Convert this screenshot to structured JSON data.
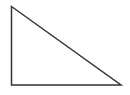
{
  "figure": {
    "name": "right-triangle",
    "canvas": {
      "width": 130,
      "height": 95,
      "background_color": "#ffffff"
    },
    "shape": {
      "type": "triangle",
      "variant": "right-triangle",
      "right_angle_vertex": "bottom-left",
      "stroke_color": "#333333",
      "stroke_width": 1.5,
      "fill": "none",
      "vertices": [
        {
          "label": "top-left-apex",
          "x": 11.5,
          "y": 6.5
        },
        {
          "label": "bottom-right",
          "x": 121,
          "y": 85
        },
        {
          "label": "bottom-left-right-angle",
          "x": 11.5,
          "y": 85
        }
      ],
      "points_attr": "11.5,6.5 121,85 11.5,85",
      "edges": [
        {
          "name": "hypotenuse",
          "from": "top-left-apex",
          "to": "bottom-right"
        },
        {
          "name": "base",
          "from": "bottom-right",
          "to": "bottom-left-right-angle"
        },
        {
          "name": "vertical-leg",
          "from": "bottom-left-right-angle",
          "to": "top-left-apex"
        }
      ]
    },
    "labels": []
  }
}
